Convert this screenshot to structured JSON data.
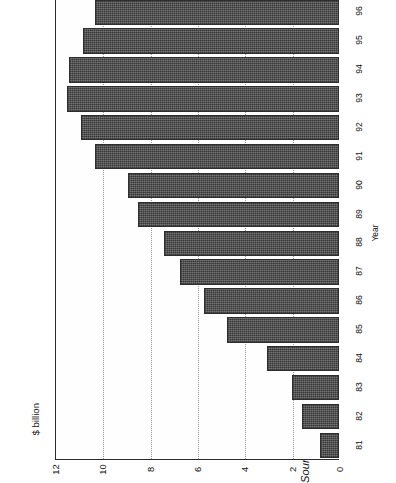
{
  "figure": {
    "title": "FIGURE 6.1  Total unfunded liabilities, Ontario Workers' Compensation, 1981–96",
    "source_prefix": "Source:",
    "source_text": " Ontario Workers' Compensation Board, Annual Report, 1996"
  },
  "axes": {
    "value_axis_label": "$ billion",
    "category_axis_label": "Year",
    "value_ticks": [
      "12",
      "10",
      "8",
      "6",
      "4",
      "2",
      "0"
    ],
    "category_ticks": [
      "96",
      "95",
      "94",
      "93",
      "92",
      "91",
      "90",
      "89",
      "88",
      "87",
      "86",
      "85",
      "84",
      "83",
      "82",
      "81"
    ]
  },
  "colors": {
    "bar_fill": "#585858",
    "bar_border": "#2e2e2e",
    "axis": "#2b2b2b",
    "gridline": "#9a9a9a",
    "background": "#ffffff",
    "text": "#111111"
  },
  "chart_data": {
    "type": "bar",
    "orientation": "horizontal",
    "title": "FIGURE 6.1  Total unfunded liabilities, Ontario Workers' Compensation, 1981–96",
    "xlabel": "$ billion",
    "ylabel": "Year",
    "xlim": [
      0,
      12
    ],
    "xticks": [
      0,
      2,
      4,
      6,
      8,
      10,
      12
    ],
    "grid": "vertical-dotted",
    "legend": "none",
    "categories": [
      "96",
      "95",
      "94",
      "93",
      "92",
      "91",
      "90",
      "89",
      "88",
      "87",
      "86",
      "85",
      "84",
      "83",
      "82",
      "81"
    ],
    "values": [
      10.3,
      10.8,
      11.4,
      11.5,
      10.9,
      10.3,
      8.9,
      8.5,
      7.4,
      6.7,
      5.7,
      4.75,
      3.05,
      2.0,
      1.55,
      0.8
    ],
    "units": "billions of dollars",
    "source": "Ontario Workers' Compensation Board, Annual Report, 1996"
  }
}
